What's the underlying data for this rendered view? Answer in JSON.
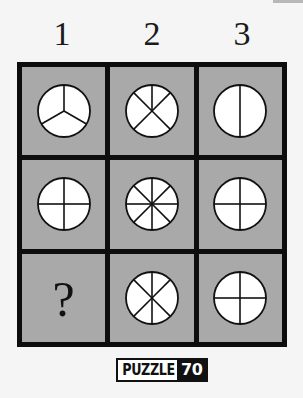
{
  "puzzle": {
    "badge_label": "PUZZLE",
    "badge_number": "70",
    "columns": [
      "1",
      "2",
      "3"
    ],
    "colors": {
      "cell_background": "#a9a9a9",
      "grid_border": "#0d0d0d",
      "circle_fill": "#ffffff",
      "line": "#111111"
    },
    "cells": [
      {
        "row": 1,
        "col": 1,
        "type": "circle",
        "segments": 3,
        "radii_degrees": [
          0,
          120,
          240
        ]
      },
      {
        "row": 1,
        "col": 2,
        "type": "circle",
        "segments": 5,
        "radii_degrees": [
          0,
          45,
          135,
          225,
          315
        ]
      },
      {
        "row": 1,
        "col": 3,
        "type": "circle",
        "segments": 2,
        "radii_degrees": [
          0,
          180
        ]
      },
      {
        "row": 2,
        "col": 1,
        "type": "circle",
        "segments": 4,
        "radii_degrees": [
          0,
          90,
          180,
          270
        ]
      },
      {
        "row": 2,
        "col": 2,
        "type": "circle",
        "segments": 8,
        "radii_degrees": [
          0,
          45,
          90,
          135,
          180,
          225,
          270,
          315
        ]
      },
      {
        "row": 2,
        "col": 3,
        "type": "circle",
        "segments": 4,
        "radii_degrees": [
          0,
          90,
          180,
          270
        ]
      },
      {
        "row": 3,
        "col": 1,
        "type": "unknown",
        "text": "?"
      },
      {
        "row": 3,
        "col": 2,
        "type": "circle",
        "segments": 6,
        "radii_degrees": [
          0,
          45,
          135,
          180,
          225,
          315
        ]
      },
      {
        "row": 3,
        "col": 3,
        "type": "circle",
        "segments": 4,
        "radii_degrees": [
          0,
          90,
          180,
          270
        ]
      }
    ]
  }
}
